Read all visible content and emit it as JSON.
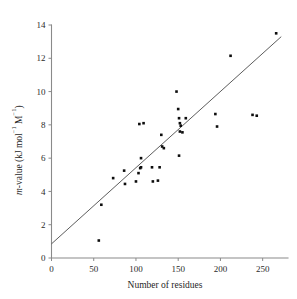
{
  "chart_data": {
    "type": "scatter",
    "title": "",
    "xlabel": "Number of residues",
    "ylabel": "m-value (kJ mol−1 M−1)",
    "ylabel_parts": {
      "italic": "m",
      "rest": "-value (kJ mol",
      "sup1": "−1",
      "mid": " M",
      "sup2": "−1",
      "close": ")"
    },
    "xlim": [
      0,
      280
    ],
    "ylim": [
      0,
      14
    ],
    "xticks": [
      0,
      50,
      100,
      150,
      200,
      250
    ],
    "xtick_labels": [
      "0",
      "50",
      "100",
      "150",
      "200",
      "250"
    ],
    "yticks": [
      0,
      2,
      4,
      6,
      8,
      10,
      12,
      14
    ],
    "ytick_labels": [
      "0",
      "2",
      "4",
      "6",
      "8",
      "10",
      "12",
      "14"
    ],
    "grid": false,
    "legend": false,
    "marker": "square",
    "marker_color": "#0d0d0d",
    "line_color": "#4a4a4a",
    "axis_color": "#8a8a8a",
    "series": [
      {
        "name": "proteins",
        "points": [
          [
            56,
            1.05
          ],
          [
            59,
            3.2
          ],
          [
            73,
            4.8
          ],
          [
            86,
            5.25
          ],
          [
            87,
            4.45
          ],
          [
            100,
            4.6
          ],
          [
            103,
            5.1
          ],
          [
            104,
            8.05
          ],
          [
            105,
            5.4
          ],
          [
            106,
            5.45
          ],
          [
            109,
            8.1
          ],
          [
            106,
            6.0
          ],
          [
            119,
            5.45
          ],
          [
            120,
            4.6
          ],
          [
            126,
            4.65
          ],
          [
            128,
            5.45
          ],
          [
            130,
            7.4
          ],
          [
            131,
            6.7
          ],
          [
            133,
            6.6
          ],
          [
            148,
            10.0
          ],
          [
            150,
            8.95
          ],
          [
            151,
            8.4
          ],
          [
            152,
            8.1
          ],
          [
            153,
            7.95
          ],
          [
            152,
            7.6
          ],
          [
            155,
            7.55
          ],
          [
            151,
            6.15
          ],
          [
            159,
            8.4
          ],
          [
            194,
            8.65
          ],
          [
            196,
            7.9
          ],
          [
            212,
            12.15
          ],
          [
            238,
            8.6
          ],
          [
            243,
            8.55
          ],
          [
            266,
            13.5
          ]
        ]
      }
    ],
    "fit_line": {
      "name": "linear regression",
      "x_start": 0,
      "y_start": 0.85,
      "x_end": 272,
      "y_end": 13.3
    }
  }
}
